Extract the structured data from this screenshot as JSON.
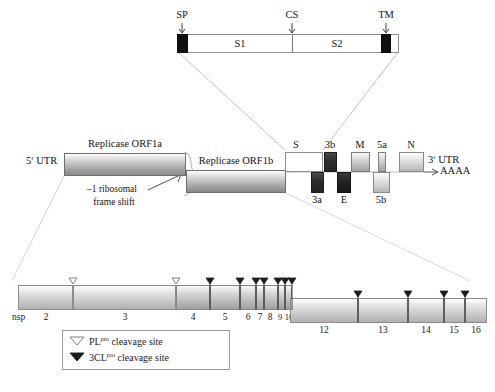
{
  "figure": {
    "type": "genome-map-diagram"
  },
  "spike_bar": {
    "name": "Spike protein domain map",
    "segments": [
      {
        "id": "sp",
        "label": "SP",
        "kind": "filled",
        "x": 177,
        "w": 11
      },
      {
        "id": "s1",
        "label": "S1",
        "kind": "open",
        "x": 188,
        "w": 104
      },
      {
        "id": "s2",
        "label": "S2",
        "kind": "open",
        "x": 292,
        "w": 89
      },
      {
        "id": "tm",
        "label": "TM",
        "kind": "filled",
        "x": 381,
        "w": 10
      },
      {
        "id": "ct",
        "label": "",
        "kind": "open",
        "x": 391,
        "w": 8
      }
    ],
    "markers": [
      {
        "label": "SP",
        "x": 182
      },
      {
        "label": "CS",
        "x": 292
      },
      {
        "label": "TM",
        "x": 386
      }
    ]
  },
  "genome": {
    "five_utr": "5ʹ UTR",
    "three_utr": "3ʹ UTR",
    "polya": "AAAA",
    "orf1a_label": "Replicase ORF1a",
    "orf1b_label": "Replicase ORF1b",
    "frameshift_line1": "–1 ribosomal",
    "frameshift_line2": "frame shift",
    "genes": [
      {
        "label": "S",
        "row": "top",
        "x": 285,
        "w": 38,
        "shade": "open"
      },
      {
        "label": "3b",
        "row": "top",
        "x": 324,
        "w": 13,
        "shade": "dark"
      },
      {
        "label": "3a",
        "row": "bottom",
        "x": 311,
        "w": 13,
        "shade": "dark"
      },
      {
        "label": "E",
        "row": "bottom",
        "x": 337,
        "w": 14,
        "shade": "darker"
      },
      {
        "label": "M",
        "row": "top",
        "x": 351,
        "w": 19,
        "shade": "mid"
      },
      {
        "label": "5a",
        "row": "top",
        "x": 378,
        "w": 8,
        "shade": "mid"
      },
      {
        "label": "5b",
        "row": "bottom",
        "x": 373,
        "w": 17,
        "shade": "light"
      },
      {
        "label": "N",
        "row": "top",
        "x": 399,
        "w": 25,
        "shade": "light"
      }
    ]
  },
  "nsp_map": {
    "prefix": "nsp",
    "row1": [
      {
        "label": "2",
        "x": 18,
        "w": 55
      },
      {
        "label": "3",
        "x": 73,
        "w": 103
      },
      {
        "label": "4",
        "x": 176,
        "w": 34
      },
      {
        "label": "5",
        "x": 210,
        "w": 30
      },
      {
        "label": "6",
        "x": 240,
        "w": 16
      },
      {
        "label": "7",
        "x": 256,
        "w": 8
      },
      {
        "label": "8",
        "x": 264,
        "w": 14
      },
      {
        "label": "9",
        "x": 278,
        "w": 7
      },
      {
        "label": "10",
        "x": 285,
        "w": 7
      }
    ],
    "row2": [
      {
        "label": "12",
        "x": 290,
        "w": 68
      },
      {
        "label": "13",
        "x": 358,
        "w": 50
      },
      {
        "label": "14",
        "x": 408,
        "w": 36
      },
      {
        "label": "15",
        "x": 444,
        "w": 21
      },
      {
        "label": "16",
        "x": 465,
        "w": 22
      }
    ],
    "pl_sites_row1_x": [
      73,
      176
    ],
    "cl_sites_row1_x": [
      210,
      240,
      256,
      264,
      278,
      285,
      292
    ],
    "cl_sites_row2_x": [
      358,
      408,
      444,
      465
    ]
  },
  "legend": {
    "items": [
      {
        "marker": "open-triangle",
        "protease": "PL",
        "sup": "pro",
        "text": " cleavage site"
      },
      {
        "marker": "filled-triangle",
        "protease": "3CL",
        "sup": "pro",
        "text": " cleavage site"
      }
    ],
    "row1_full": "PL",
    "row1_sup": "pro",
    "row1_tail": "cleavage site",
    "row2_full": "3CL",
    "row2_sup": "pro",
    "row2_tail": "cleavage site"
  },
  "colors": {
    "ink": "#1a1a1a",
    "rule": "#8f8f8f",
    "fill_dark": "#222222",
    "fill_light": "#d9d9d9",
    "connector": "#b9b9b9"
  }
}
